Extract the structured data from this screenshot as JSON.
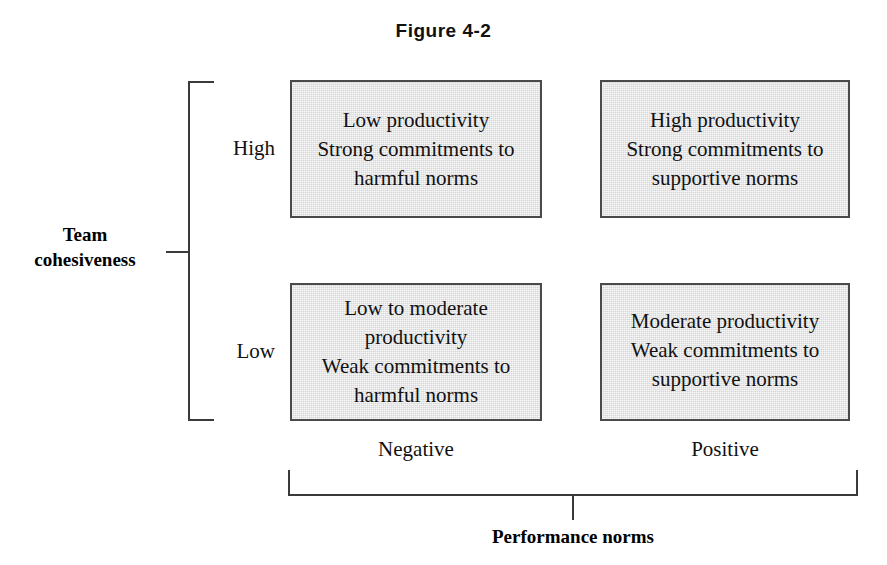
{
  "figure": {
    "title": "Figure 4-2"
  },
  "vertical_axis": {
    "title_line1": "Team",
    "title_line2": "cohesiveness",
    "levels": [
      {
        "label": "High"
      },
      {
        "label": "Low"
      }
    ]
  },
  "horizontal_axis": {
    "title": "Performance norms",
    "levels": [
      {
        "label": "Negative"
      },
      {
        "label": "Positive"
      }
    ]
  },
  "quadrants": [
    {
      "id": "high-negative",
      "cohesiveness": "High",
      "norms": "Negative",
      "lines": [
        "Low productivity",
        "Strong commitments to",
        "harmful norms"
      ]
    },
    {
      "id": "high-positive",
      "cohesiveness": "High",
      "norms": "Positive",
      "lines": [
        "High productivity",
        "Strong commitments to",
        "supportive norms"
      ]
    },
    {
      "id": "low-negative",
      "cohesiveness": "Low",
      "norms": "Negative",
      "lines": [
        "Low to moderate",
        "productivity",
        "Weak commitments to",
        "harmful norms"
      ]
    },
    {
      "id": "low-positive",
      "cohesiveness": "Low",
      "norms": "Positive",
      "lines": [
        "Moderate productivity",
        "Weak commitments to",
        "supportive norms"
      ]
    }
  ],
  "colors": {
    "box_fill": "#d6d6d6",
    "box_border": "#4a4a4a",
    "axis_line": "#3a3a3a",
    "text": "#111111",
    "background": "#ffffff"
  }
}
